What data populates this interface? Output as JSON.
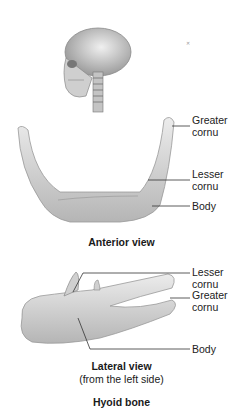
{
  "figure": {
    "title": "Hyoid bone",
    "anterior": {
      "caption": "Anterior view",
      "labels": [
        "Greater",
        "cornu",
        "Lesser",
        "cornu",
        "Body"
      ]
    },
    "lateral": {
      "caption": "Lateral view",
      "subcaption": "(from the left side)",
      "labels": [
        "Lesser",
        "cornu",
        "Greater",
        "cornu",
        "Body"
      ]
    }
  },
  "colors": {
    "bone": "#d8d8d8",
    "bone_shadow": "#a8a8a8",
    "leader_line": "#333333"
  }
}
